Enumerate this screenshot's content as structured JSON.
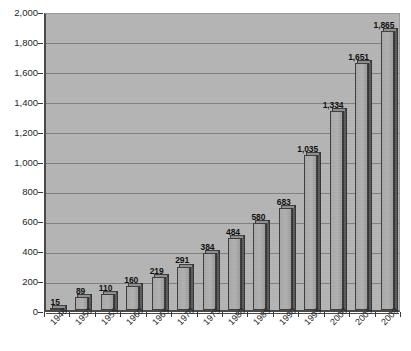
{
  "chart_data": {
    "type": "bar",
    "title": "",
    "subtitle": "",
    "xlabel": "",
    "ylabel": "",
    "categories": [
      "1946",
      "1950",
      "1955",
      "1960",
      "1965",
      "1970",
      "1975",
      "1980",
      "1985",
      "1990",
      "1995",
      "2000",
      "2005",
      "2009"
    ],
    "values": [
      15,
      89,
      110,
      160,
      219,
      291,
      384,
      484,
      580,
      683,
      1035,
      1334,
      1651,
      1865
    ],
    "value_labels": [
      "15",
      "89",
      "110",
      "160",
      "219",
      "291",
      "384",
      "484",
      "580",
      "683",
      "1,035",
      "1,334",
      "1,651",
      "1,865"
    ],
    "ylim": [
      0,
      2000
    ],
    "ytick_values": [
      0,
      200,
      400,
      600,
      800,
      1000,
      1200,
      1400,
      1600,
      1800,
      2000
    ],
    "ytick_labels": [
      "0",
      "200",
      "400",
      "600",
      "800",
      "1,000",
      "1,200",
      "1,400",
      "1,600",
      "1,800",
      "2,000"
    ],
    "grid": true,
    "grid_axis": "y",
    "legend": false,
    "legend_position": "none",
    "series": [
      {
        "name": "",
        "values": [
          15,
          89,
          110,
          160,
          219,
          291,
          384,
          484,
          580,
          683,
          1035,
          1334,
          1651,
          1865
        ]
      }
    ],
    "colors": {
      "plot_background": "#b4b4b4",
      "page_background": "#ffffff",
      "bar_face": "#a8a8a8",
      "bar_side": "#5a5a5a",
      "bar_outline": "#3c3c3c",
      "gridline": "#7e7e7e",
      "axis_line": "#4a4a4a",
      "text": "#1f1f1f"
    },
    "annotations": []
  }
}
